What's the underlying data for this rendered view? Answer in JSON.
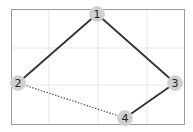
{
  "graph": {
    "frame": {
      "x": 11,
      "y": 9,
      "width": 173,
      "height": 115,
      "stroke": "#9a9a9a"
    },
    "grid": {
      "color": "#e6e6e6",
      "vertical": [
        49,
        98,
        147
      ],
      "horizontal": [
        48,
        85
      ]
    },
    "node_style": {
      "radius": 7.5,
      "fill": "#cfcfcf",
      "stroke": "#d8d8d8"
    },
    "nodes": [
      {
        "id": "1",
        "label": "1",
        "x": 97,
        "y": 14
      },
      {
        "id": "2",
        "label": "2",
        "x": 18,
        "y": 83
      },
      {
        "id": "3",
        "label": "3",
        "x": 175,
        "y": 83
      },
      {
        "id": "4",
        "label": "4",
        "x": 125,
        "y": 118
      }
    ],
    "edges": [
      {
        "from": "1",
        "to": "2",
        "style": "solid",
        "color": "#333333"
      },
      {
        "from": "1",
        "to": "3",
        "style": "solid",
        "color": "#333333"
      },
      {
        "from": "3",
        "to": "4",
        "style": "solid",
        "color": "#333333"
      },
      {
        "from": "2",
        "to": "4",
        "style": "dotted",
        "color": "#555555"
      }
    ]
  }
}
